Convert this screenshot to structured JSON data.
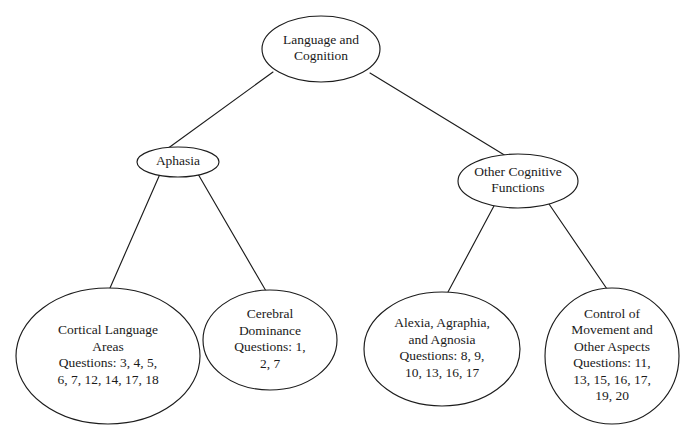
{
  "diagram": {
    "type": "tree",
    "background_color": "#ffffff",
    "stroke_color": "#1c1c1c",
    "text_color": "#1a1a1a",
    "node_shape": "ellipse",
    "nodes": [
      {
        "id": "root",
        "level": 0,
        "lines": [
          "Language and",
          "Cognition"
        ],
        "cx": 321,
        "cy": 49,
        "rx": 59,
        "ry": 33
      },
      {
        "id": "aphasia",
        "level": 1,
        "lines": [
          "Aphasia"
        ],
        "cx": 178,
        "cy": 162,
        "rx": 41,
        "ry": 15
      },
      {
        "id": "other-cognitive-functions",
        "level": 1,
        "lines": [
          "Other Cognitive",
          "Functions"
        ],
        "cx": 518,
        "cy": 181,
        "rx": 60,
        "ry": 27
      },
      {
        "id": "cortical-language-areas",
        "level": 2,
        "lines": [
          "Cortical Language",
          "Areas",
          "Questions: 3, 4, 5,",
          "6, 7, 12, 14, 17, 18"
        ],
        "cx": 108,
        "cy": 356,
        "rx": 92,
        "ry": 68
      },
      {
        "id": "cerebral-dominance",
        "level": 2,
        "lines": [
          "Cerebral",
          "Dominance",
          "Questions: 1,",
          "2, 7"
        ],
        "cx": 270,
        "cy": 340,
        "rx": 67,
        "ry": 50
      },
      {
        "id": "alexia-agraphia-agnosia",
        "level": 2,
        "lines": [
          "Alexia, Agraphia,",
          "and Agnosia",
          "Questions: 8, 9,",
          "10, 13, 16, 17"
        ],
        "cx": 442,
        "cy": 349,
        "rx": 78,
        "ry": 57
      },
      {
        "id": "control-of-movement",
        "level": 2,
        "lines": [
          "Control of",
          "Movement and",
          "Other Aspects",
          "Questions: 11,",
          "13, 15, 16, 17,",
          "19, 20"
        ],
        "cx": 612,
        "cy": 356,
        "rx": 67,
        "ry": 68
      }
    ],
    "edges": [
      {
        "id": "root-to-aphasia",
        "from": "root",
        "to": "aphasia",
        "x1": 273,
        "y1": 72,
        "x2": 167,
        "y2": 149
      },
      {
        "id": "root-to-other-cognitive-functions",
        "from": "root",
        "to": "other-cognitive-functions",
        "x1": 370,
        "y1": 73,
        "x2": 506,
        "y2": 156
      },
      {
        "id": "aphasia-to-cortical-language-areas",
        "from": "aphasia",
        "to": "cortical-language-areas",
        "x1": 160,
        "y1": 174,
        "x2": 110,
        "y2": 288
      },
      {
        "id": "aphasia-to-cerebral-dominance",
        "from": "aphasia",
        "to": "cerebral-dominance",
        "x1": 198,
        "y1": 174,
        "x2": 266,
        "y2": 291
      },
      {
        "id": "other-cognitive-functions-to-alexia",
        "from": "other-cognitive-functions",
        "to": "alexia-agraphia-agnosia",
        "x1": 495,
        "y1": 204,
        "x2": 448,
        "y2": 292
      },
      {
        "id": "other-cognitive-functions-to-control-of-movement",
        "from": "other-cognitive-functions",
        "to": "control-of-movement",
        "x1": 549,
        "y1": 204,
        "x2": 607,
        "y2": 289
      }
    ]
  }
}
